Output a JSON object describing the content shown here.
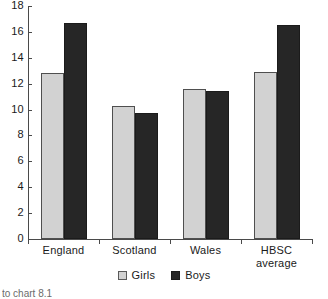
{
  "chart_data": {
    "type": "bar",
    "title": "",
    "subtitle": "",
    "xlabel": "",
    "ylabel": "",
    "categories": [
      "England",
      "Scotland",
      "Wales",
      "HBSC average"
    ],
    "category_lines": [
      [
        "England"
      ],
      [
        "Scotland"
      ],
      [
        "Wales"
      ],
      [
        "HBSC",
        "average"
      ]
    ],
    "series": [
      {
        "name": "Girls",
        "color": "#d2d2d2",
        "values": [
          12.8,
          10.3,
          11.6,
          12.9
        ]
      },
      {
        "name": "Boys",
        "color": "#262626",
        "values": [
          16.7,
          9.75,
          11.45,
          16.55
        ]
      }
    ],
    "ylim": [
      0,
      18
    ],
    "ytick_values": [
      0,
      2,
      4,
      6,
      8,
      10,
      12,
      14,
      16,
      18
    ],
    "ytick_labels": [
      "0",
      "2",
      "4",
      "6",
      "8",
      "10",
      "12",
      "14",
      "16",
      "18"
    ],
    "grid": false,
    "legend_position": "bottom-center",
    "legend_entries": [
      "Girls",
      "Boys"
    ]
  },
  "legend": {
    "girls_label": "Girls",
    "boys_label": "Boys",
    "girls_swatch_icon": "square-light-gray-icon",
    "boys_swatch_icon": "square-black-icon"
  },
  "caption": {
    "text": "to chart 8.1"
  }
}
